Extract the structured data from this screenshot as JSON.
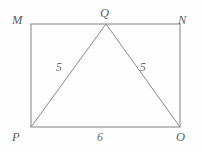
{
  "figure": {
    "type": "geometry-diagram",
    "background_color": "#fefefe",
    "line_color": "#8a8a8a",
    "label_color": "#5f5f5f",
    "vertices": [
      {
        "id": "M",
        "label": "M",
        "x": 31,
        "y": 24
      },
      {
        "id": "N",
        "label": "N",
        "x": 180,
        "y": 24
      },
      {
        "id": "Q",
        "label": "Q",
        "x": 106,
        "y": 24
      },
      {
        "id": "P",
        "label": "P",
        "x": 31,
        "y": 127
      },
      {
        "id": "O",
        "label": "O",
        "x": 180,
        "y": 127
      }
    ],
    "rectangle": {
      "left": 31,
      "top": 24,
      "right": 180,
      "bottom": 127
    },
    "triangle": {
      "points": "31,127 106,24 180,127"
    },
    "measures": {
      "left_leg": "5",
      "right_leg": "5",
      "base": "6"
    }
  }
}
